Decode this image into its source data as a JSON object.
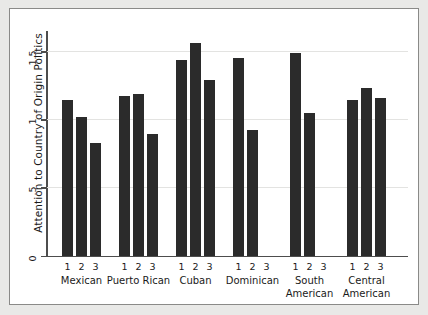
{
  "chart": {
    "ylabel": "Attention to Country of Origin Politics",
    "yticks": [
      "0",
      ".5",
      "1",
      "1.5"
    ],
    "bar_color": "#2b2b2b",
    "background": "#e9e9e7",
    "plot_background": "#ffffff"
  },
  "chart_data": {
    "type": "bar",
    "title": "",
    "xlabel": "",
    "ylabel": "Attention to Country of Origin Politics",
    "ylim": [
      0,
      1.65
    ],
    "yticks": [
      0,
      0.5,
      1,
      1.5
    ],
    "ytick_labels": [
      "0",
      ".5",
      "1",
      "1.5"
    ],
    "grid": true,
    "legend": "none",
    "categories": [
      "Mexican",
      "Puerto Rican",
      "Cuban",
      "Dominican",
      "South American",
      "Central American"
    ],
    "subcategories": [
      "1",
      "2",
      "3"
    ],
    "groups": [
      {
        "label": "Mexican",
        "label_lines": [
          "Mexican"
        ],
        "bars": [
          {
            "tick": "1",
            "value": 1.14
          },
          {
            "tick": "2",
            "value": 1.02
          },
          {
            "tick": "3",
            "value": 0.83
          }
        ]
      },
      {
        "label": "Puerto Rican",
        "label_lines": [
          "Puerto Rican"
        ],
        "bars": [
          {
            "tick": "1",
            "value": 1.17
          },
          {
            "tick": "2",
            "value": 1.19
          },
          {
            "tick": "3",
            "value": 0.89
          }
        ]
      },
      {
        "label": "Cuban",
        "label_lines": [
          "Cuban"
        ],
        "bars": [
          {
            "tick": "1",
            "value": 1.44
          },
          {
            "tick": "2",
            "value": 1.56
          },
          {
            "tick": "3",
            "value": 1.29
          }
        ]
      },
      {
        "label": "Dominican",
        "label_lines": [
          "Dominican"
        ],
        "bars": [
          {
            "tick": "1",
            "value": 1.45
          },
          {
            "tick": "2",
            "value": 0.92
          },
          {
            "tick": "3",
            "value": null
          }
        ]
      },
      {
        "label": "South American",
        "label_lines": [
          "South",
          "American"
        ],
        "bars": [
          {
            "tick": "1",
            "value": 1.49
          },
          {
            "tick": "2",
            "value": 1.05
          },
          {
            "tick": "3",
            "value": null
          }
        ]
      },
      {
        "label": "Central American",
        "label_lines": [
          "Central",
          "American"
        ],
        "bars": [
          {
            "tick": "1",
            "value": 1.14
          },
          {
            "tick": "2",
            "value": 1.23
          },
          {
            "tick": "3",
            "value": 1.16
          }
        ]
      }
    ]
  }
}
